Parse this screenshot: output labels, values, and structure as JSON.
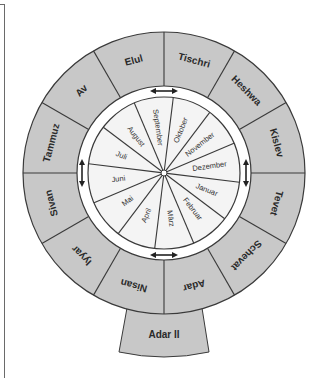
{
  "diagram": {
    "type": "hebrew-gregorian-calendar-wheel",
    "colors": {
      "outer_ring": "#c8c8c8",
      "inner_wheel": "#f4f4f4",
      "band": "#ffffff",
      "stroke": "#3a3a3a"
    },
    "outer_ring": {
      "description": "Hebrew months",
      "months": [
        {
          "label": "Tischri",
          "angle": -75
        },
        {
          "label": "Heshwa",
          "angle": -45
        },
        {
          "label": "Kislev",
          "angle": -15
        },
        {
          "label": "Tevet",
          "angle": 15
        },
        {
          "label": "Schevat",
          "angle": 45
        },
        {
          "label": "Adar",
          "angle": 75
        },
        {
          "label": "Nisan",
          "angle": 105
        },
        {
          "label": "Iyyar",
          "angle": 135
        },
        {
          "label": "Sivan",
          "angle": 165
        },
        {
          "label": "Tammuz",
          "angle": 195
        },
        {
          "label": "Av",
          "angle": 225
        },
        {
          "label": "Elul",
          "angle": 255
        }
      ]
    },
    "leap_month": {
      "label": "Adar  II"
    },
    "inner_wheel": {
      "description": "Gregorian months (German)",
      "months": [
        {
          "label": "Dezember",
          "angle": 0
        },
        {
          "label": "Januar",
          "angle": 30
        },
        {
          "label": "Februar",
          "angle": 60
        },
        {
          "label": "März",
          "angle": 90
        },
        {
          "label": "April",
          "angle": 120
        },
        {
          "label": "Mai",
          "angle": 150
        },
        {
          "label": "Juni",
          "angle": 180
        },
        {
          "label": "Juli",
          "angle": 210
        },
        {
          "label": "August",
          "angle": 240
        },
        {
          "label": "September",
          "angle": 270
        },
        {
          "label": "Oktober",
          "angle": 300
        },
        {
          "label": "November",
          "angle": 330
        }
      ]
    },
    "arrows": [
      {
        "position": "top",
        "icon": "double-arrow-horizontal"
      },
      {
        "position": "bottom",
        "icon": "double-arrow-horizontal"
      },
      {
        "position": "left",
        "icon": "double-arrow-vertical"
      },
      {
        "position": "right",
        "icon": "double-arrow-vertical"
      }
    ]
  }
}
